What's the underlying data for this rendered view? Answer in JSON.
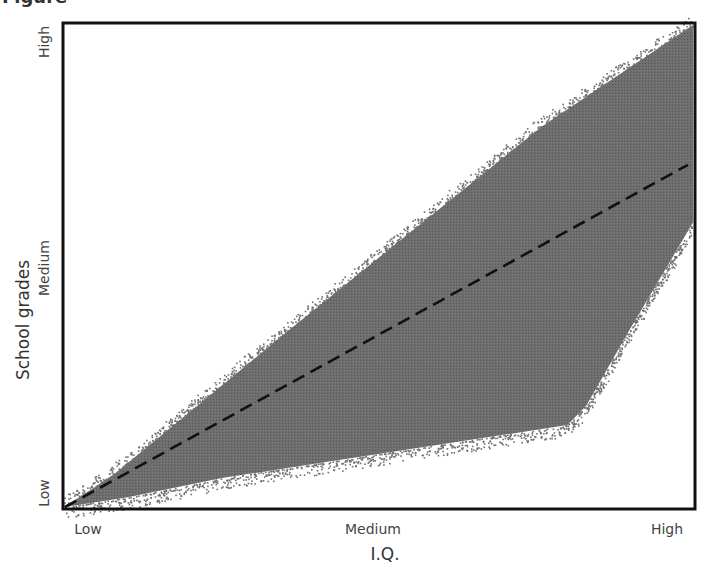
{
  "figure": {
    "caption_fragment": "Figure"
  },
  "chart_data": {
    "type": "scatter",
    "title": "",
    "xlabel": "I.Q.",
    "ylabel": "School grades",
    "x_ticks": [
      "Low",
      "Medium",
      "High"
    ],
    "y_ticks": [
      "Low",
      "Medium",
      "High"
    ],
    "xlim": [
      0,
      1
    ],
    "ylim": [
      0,
      1
    ],
    "grid": false,
    "legend": null,
    "cloud": {
      "description": "Dense gray point cloud; upper boundary rises nearly linearly from origin to the top-right corner; lower boundary rises slowly then bends sharply upward near high I.Q.",
      "color": "#666666",
      "upper_boundary": [
        [
          0.0,
          0.0
        ],
        [
          0.08,
          0.07
        ],
        [
          0.22,
          0.22
        ],
        [
          0.35,
          0.36
        ],
        [
          0.55,
          0.57
        ],
        [
          0.76,
          0.79
        ],
        [
          1.0,
          1.0
        ]
      ],
      "lower_boundary": [
        [
          0.0,
          0.0
        ],
        [
          0.1,
          0.02
        ],
        [
          0.25,
          0.06
        ],
        [
          0.4,
          0.09
        ],
        [
          0.6,
          0.13
        ],
        [
          0.8,
          0.17
        ],
        [
          0.83,
          0.21
        ],
        [
          0.9,
          0.37
        ],
        [
          1.0,
          0.59
        ]
      ]
    },
    "trend_line": {
      "style": "dashed",
      "color": "#111111",
      "points": [
        [
          0.0,
          0.0
        ],
        [
          1.0,
          0.71
        ]
      ]
    }
  }
}
